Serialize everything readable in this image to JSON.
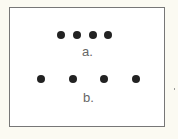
{
  "figure": {
    "rows": [
      {
        "label": "a.",
        "dot_count": 4,
        "spacing": "close"
      },
      {
        "label": "b.",
        "dot_count": 4,
        "spacing": "wide"
      }
    ]
  }
}
